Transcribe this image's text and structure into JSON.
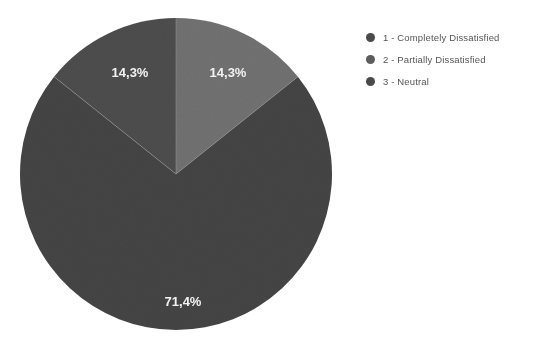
{
  "canvas": {
    "width": 536,
    "height": 346,
    "background": "#ffffff"
  },
  "chart_data": {
    "type": "pie",
    "title": "",
    "subtitle": "",
    "xlabel": "",
    "ylabel": "",
    "grid": false,
    "legend_position": "right",
    "decimal_separator": ",",
    "total_percent": "100,0%",
    "categories": [
      "1 - Completely Dissatisfied",
      "2 - Partially Dissatisfied",
      "3 - Neutral"
    ],
    "values": [
      14.3,
      14.3,
      71.4
    ],
    "labels": [
      "14,3%",
      "14,3%",
      "71,4%"
    ],
    "colors": [
      "#4a4a4a",
      "#6d6d6d",
      "#424242"
    ],
    "slices": [
      {
        "index": 1,
        "name": "1 - Completely Dissatisfied",
        "value": 14.3,
        "label": "14,3%",
        "color": "#4a4a4a",
        "start_angle_deg": 308.6,
        "end_angle_deg": 360.0,
        "label_x": 130,
        "label_y": 74
      },
      {
        "index": 2,
        "name": "2 - Partially Dissatisfied",
        "value": 14.3,
        "label": "14,3%",
        "color": "#6d6d6d",
        "start_angle_deg": 0.0,
        "end_angle_deg": 51.4,
        "label_x": 228,
        "label_y": 74
      },
      {
        "index": 3,
        "name": "3 - Neutral",
        "value": 71.4,
        "label": "71,4%",
        "color": "#424242",
        "start_angle_deg": 51.4,
        "end_angle_deg": 308.6,
        "label_x": 183,
        "label_y": 303
      }
    ],
    "geometry": {
      "center_x": 176,
      "center_y": 174,
      "radius": 156,
      "separator_color": "#9a9a9a",
      "separator_width": 1
    },
    "label_color": "#f2f2f2"
  },
  "legend": {
    "text_color": "#555555",
    "items": [
      {
        "label": "1 - Completely Dissatisfied",
        "marker": "legend-dot-icon",
        "color": "#4a4a4a"
      },
      {
        "label": "2 - Partially Dissatisfied",
        "marker": "legend-dot-icon",
        "color": "#5c5c5c"
      },
      {
        "label": "3 - Neutral",
        "marker": "legend-dot-icon",
        "color": "#4a4a4a"
      }
    ]
  }
}
